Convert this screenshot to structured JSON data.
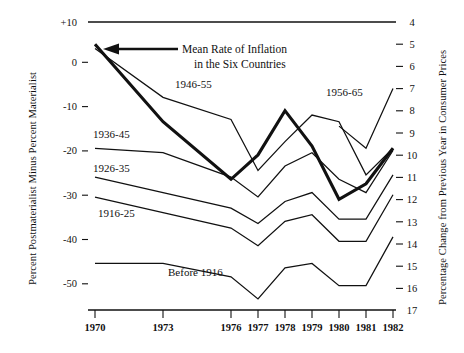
{
  "chart_data": {
    "type": "line",
    "title": "",
    "xlabel": "",
    "ylabel": "Percent Postmaterialist Minus Percent Materialist",
    "y2label": "Percentage Change from Previous Year in Consumer Prices",
    "x": [
      1970,
      1973,
      1976,
      1977,
      1978,
      1979,
      1980,
      1981,
      1982
    ],
    "xticklabels": [
      "1970",
      "1973",
      "1976",
      "1977",
      "1978",
      "1979",
      "1980",
      "1981",
      "1982"
    ],
    "ylim": [
      -55,
      10
    ],
    "yticks": [
      10,
      0,
      -10,
      -20,
      -30,
      -40,
      -50
    ],
    "yticklabels": [
      "+10",
      "0",
      "-10",
      "-20",
      "-30",
      "-40",
      "-50"
    ],
    "y2lim": [
      17,
      4
    ],
    "y2ticks": [
      4,
      5,
      6,
      7,
      8,
      9,
      10,
      11,
      12,
      13,
      14,
      15,
      16,
      17
    ],
    "y2ticklabels": [
      "4",
      "5",
      "6",
      "7",
      "8",
      "9",
      "10",
      "11",
      "12",
      "13",
      "14",
      "15",
      "16",
      "17"
    ],
    "grid": false,
    "legend_position": "inline-labels",
    "series": [
      {
        "name": "Mean Rate of Inflation in the Six Countries",
        "axis": "right",
        "style": "bold",
        "label": "Mean Rate of Inflation\nin the Six Countries",
        "x": [
          1970,
          1973,
          1976,
          1977,
          1978,
          1979,
          1980,
          1981,
          1982
        ],
        "values": [
          5.0,
          8.5,
          11.1,
          10.0,
          8.0,
          9.6,
          12.0,
          11.3,
          9.7
        ]
      },
      {
        "name": "1946-55",
        "axis": "left",
        "style": "thin",
        "label": "1946-55",
        "x": [
          1970,
          1973,
          1976,
          1977,
          1978,
          1979,
          1980,
          1981,
          1982
        ],
        "values": [
          4.0,
          -7.0,
          -12.0,
          -23.5,
          -17.0,
          -11.0,
          -12.5,
          -24.5,
          -18.5
        ]
      },
      {
        "name": "1956-65",
        "axis": "left",
        "style": "thin",
        "label": "1956-65",
        "x": [
          1980,
          1981,
          1982
        ],
        "values": [
          -13.5,
          -18.5,
          -5.0
        ]
      },
      {
        "name": "1936-45",
        "axis": "left",
        "style": "thin",
        "label": "1936-45",
        "x": [
          1970,
          1973,
          1976,
          1977,
          1978,
          1979,
          1980,
          1981,
          1982
        ],
        "values": [
          -18.5,
          -19.5,
          -25.0,
          -29.5,
          -22.5,
          -19.5,
          -25.5,
          -28.5,
          -19.0
        ]
      },
      {
        "name": "1926-35",
        "axis": "left",
        "style": "thin",
        "label": "1926-35",
        "x": [
          1970,
          1973,
          1976,
          1977,
          1978,
          1979,
          1980,
          1981,
          1982
        ],
        "values": [
          -25.0,
          -28.5,
          -32.0,
          -35.5,
          -30.5,
          -28.5,
          -34.5,
          -34.5,
          -24.5
        ]
      },
      {
        "name": "1916-25",
        "axis": "left",
        "style": "thin",
        "label": "1916-25",
        "x": [
          1970,
          1973,
          1976,
          1977,
          1978,
          1979,
          1980,
          1981,
          1982
        ],
        "values": [
          -29.5,
          -33.0,
          -36.5,
          -40.5,
          -35.0,
          -33.5,
          -39.5,
          -39.5,
          -29.0
        ]
      },
      {
        "name": "Before 1916",
        "axis": "left",
        "style": "thin",
        "label": "Before 1916",
        "x": [
          1970,
          1973,
          1976,
          1977,
          1978,
          1979,
          1980,
          1981,
          1982
        ],
        "values": [
          -44.5,
          -44.5,
          -47.5,
          -52.5,
          -45.5,
          -44.5,
          -49.5,
          -49.5,
          -38.5
        ]
      }
    ],
    "annotations": [
      {
        "name": "inflation-callout-line1",
        "text": "Mean Rate of Inflation"
      },
      {
        "name": "inflation-callout-line2",
        "text": "in the Six Countries"
      }
    ]
  }
}
